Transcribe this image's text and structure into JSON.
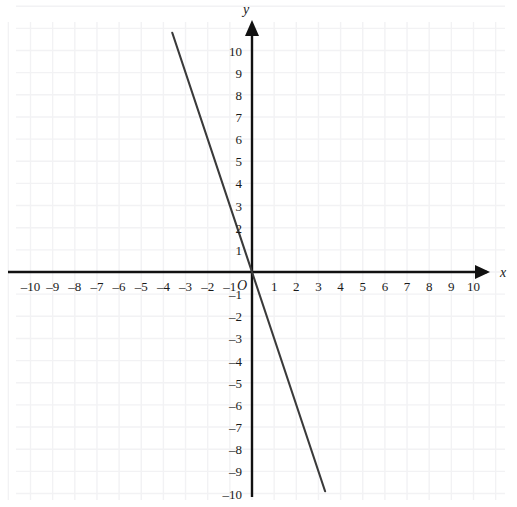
{
  "chart_data": {
    "type": "line",
    "title": "",
    "xlabel": "x",
    "ylabel": "y",
    "origin_label": "O",
    "xlim": [
      -11.0,
      11.9
    ],
    "ylim": [
      -10.6,
      12.2
    ],
    "grid": true,
    "grid_step": 1,
    "legend": null,
    "xticks": [
      -10,
      -9,
      -8,
      -7,
      -6,
      -5,
      -4,
      -3,
      -2,
      -1,
      1,
      2,
      3,
      4,
      5,
      6,
      7,
      8,
      9,
      10
    ],
    "yticks": [
      10,
      9,
      8,
      7,
      6,
      5,
      4,
      3,
      2,
      1,
      -1,
      -2,
      -3,
      -4,
      -5,
      -6,
      -7,
      -8,
      -9,
      -10
    ],
    "xtick_labels": [
      "–10",
      "–9",
      "–8",
      "–7",
      "–6",
      "–5",
      "–4",
      "–3",
      "–2",
      "–1",
      "1",
      "2",
      "3",
      "4",
      "5",
      "6",
      "7",
      "8",
      "9",
      "10"
    ],
    "ytick_labels": [
      "10",
      "9",
      "8",
      "7",
      "6",
      "5",
      "4",
      "3",
      "2",
      "1",
      "–1",
      "–2",
      "–3",
      "–4",
      "–5",
      "–6",
      "–7",
      "–8",
      "–9",
      "–10"
    ],
    "series": [
      {
        "name": "line",
        "equation": "y = -3x",
        "slope": -3,
        "intercept": 0,
        "x": [
          -3.6,
          3.3
        ],
        "values": [
          10.8,
          -9.9
        ],
        "color": "#3a3a3a"
      }
    ]
  },
  "axes": {
    "x_axis_name": "x",
    "y_axis_name": "y",
    "origin_label": "O",
    "x_arrow": "right",
    "y_arrow": "up"
  },
  "colors": {
    "axis": "#111111",
    "grid": "#f2f2f4",
    "line": "#3a3a3a",
    "text": "#1a1a1a",
    "background": "#ffffff"
  }
}
